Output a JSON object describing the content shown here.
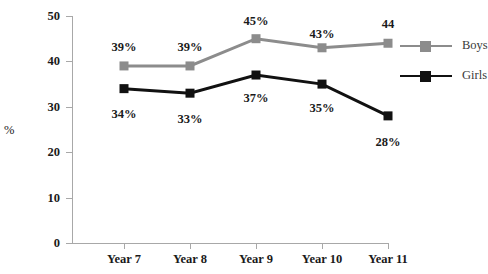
{
  "chart_data": {
    "type": "line",
    "title": "",
    "xlabel": "",
    "ylabel": "%",
    "categories": [
      "Year 7",
      "Year 8",
      "Year 9",
      "Year 10",
      "Year 11"
    ],
    "ylim": [
      0,
      50
    ],
    "yticks": [
      0,
      10,
      20,
      30,
      40,
      50
    ],
    "grid": false,
    "legend_position": "right",
    "series": [
      {
        "name": "Boys",
        "color": "#8c8c8c",
        "values": [
          39,
          39,
          45,
          43,
          44
        ],
        "labels": [
          "39%",
          "39%",
          "45%",
          "43%",
          "44"
        ],
        "label_position": "above"
      },
      {
        "name": "Girls",
        "color": "#111111",
        "values": [
          34,
          33,
          37,
          35,
          28
        ],
        "labels": [
          "34%",
          "33%",
          "37%",
          "35%",
          "28%"
        ],
        "label_position": "below"
      }
    ]
  },
  "axis": {
    "y_label": "%",
    "y_ticks": [
      "50",
      "40",
      "30",
      "20",
      "10",
      "0"
    ],
    "x_ticks": [
      "Year 7",
      "Year 8",
      "Year 9",
      "Year 10",
      "Year 11"
    ]
  },
  "legend": {
    "items": [
      {
        "label": "Boys",
        "color": "#8c8c8c"
      },
      {
        "label": "Girls",
        "color": "#111111"
      }
    ]
  },
  "data_labels": {
    "boys": [
      "39%",
      "39%",
      "45%",
      "43%",
      "44"
    ],
    "girls": [
      "34%",
      "33%",
      "37%",
      "35%",
      "28%"
    ]
  },
  "colors": {
    "boys_line": "#8c8c8c",
    "girls_line": "#111111",
    "axis": "#a8a8a8",
    "text": "#1a1a1a",
    "background": "#ffffff"
  }
}
